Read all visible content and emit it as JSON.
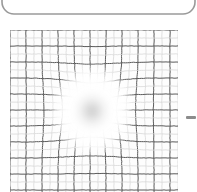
{
  "figure": {
    "caption": "",
    "background_color": "#ffffff"
  },
  "panel_frame": {
    "name": "rounded-panel-outline",
    "visible": true,
    "stroke_color": "#9a9a9a",
    "stroke_width": 1.6,
    "x": 2,
    "y": -28,
    "width": 193,
    "height": 42,
    "corner_radius": 12,
    "description": "rounded rectangle border clipped by the top edge of the image"
  },
  "side_marker": {
    "name": "right-edge-dash",
    "visible": true,
    "color": "#8c8c8c",
    "x": 186,
    "y": 116,
    "width": 10,
    "height": 3
  },
  "chart_data": {
    "type": "heatmap",
    "subtitle": "",
    "xlabel": "",
    "ylabel": "",
    "legend_position": "none",
    "grid": true,
    "grid_type": "amsler",
    "grid_bounds": {
      "x": 10,
      "y": 30,
      "width": 168,
      "height": 168
    },
    "grid_columns": 21,
    "grid_rows": 21,
    "cell_size": 8,
    "xlim": [
      0,
      21
    ],
    "ylim": [
      0,
      21
    ],
    "tick_labels_x": [],
    "tick_labels_y": [],
    "line_color": "#5a5a5a",
    "line_width": 1.0,
    "faint_line_color": "#d8d8d8",
    "background_color": "#fdfdfd",
    "scotoma": {
      "label": "central scotoma",
      "center_x": 92,
      "center_y": 110,
      "radius_x": 42,
      "radius_y": 45,
      "fill_color": "#ffffff",
      "core_color": "#b8b8b8",
      "core_radius": 16,
      "opacity": 1.0
    },
    "distortion": {
      "label": "metamorphopsia",
      "strength": 0.55,
      "falloff_radius": 78,
      "description": "grid lines bend and are pulled toward the scotoma centre"
    },
    "series": [
      {
        "name": "vertical grid lines",
        "count": 22,
        "values": [
          0,
          1,
          2,
          3,
          4,
          5,
          6,
          7,
          8,
          9,
          10,
          11,
          12,
          13,
          14,
          15,
          16,
          17,
          18,
          19,
          20,
          21
        ]
      },
      {
        "name": "horizontal grid lines",
        "count": 22,
        "values": [
          0,
          1,
          2,
          3,
          4,
          5,
          6,
          7,
          8,
          9,
          10,
          11,
          12,
          13,
          14,
          15,
          16,
          17,
          18,
          19,
          20,
          21
        ]
      }
    ]
  }
}
